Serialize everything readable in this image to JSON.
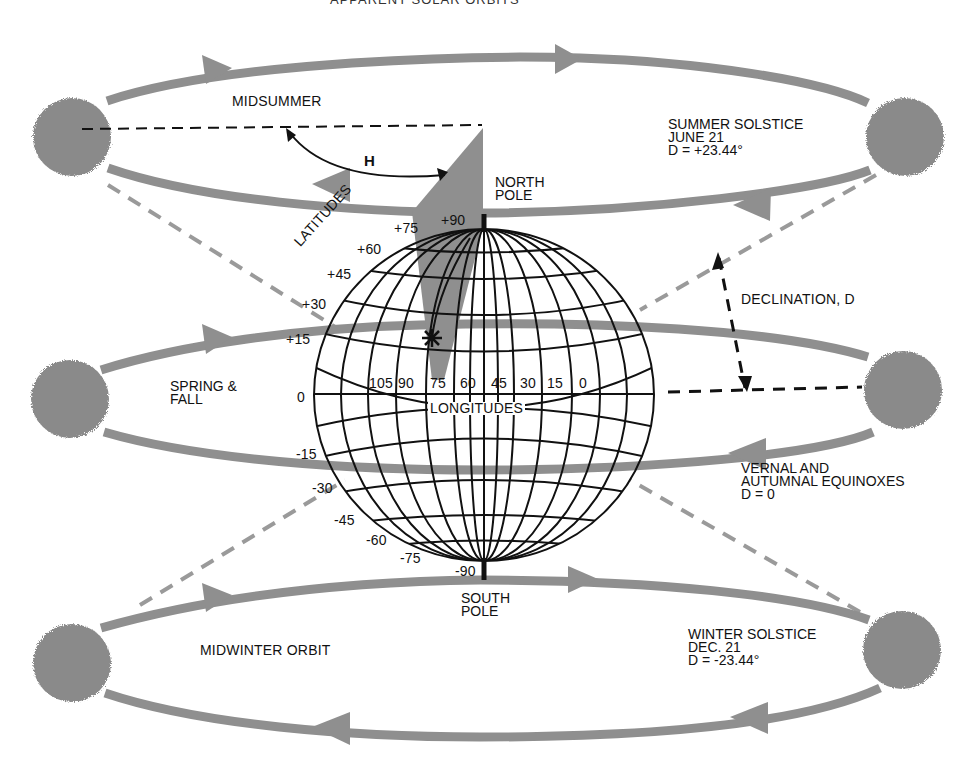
{
  "title": "APPARENT SOLAR ORBITS",
  "colors": {
    "orbit": "#8f8f8f",
    "sun": "#8a8a8a",
    "grid": "#111111",
    "dashed_black": "#111111",
    "dashed_gray": "#9a9a9a",
    "background": "#ffffff"
  },
  "orbits": [
    {
      "name": "midsummer",
      "label": "MIDSUMMER"
    },
    {
      "name": "spring-fall",
      "label_lines": [
        "SPRING &",
        "FALL"
      ]
    },
    {
      "name": "midwinter",
      "label": "MIDWINTER ORBIT"
    }
  ],
  "annotations": {
    "summer_solstice": [
      "SUMMER SOLSTICE",
      "JUNE 21",
      "D =  +23.44°"
    ],
    "equinoxes": [
      "VERNAL AND",
      "AUTUMNAL EQUINOXES",
      "D = 0"
    ],
    "winter_solstice": [
      "WINTER SOLSTICE",
      "DEC. 21",
      "D = -23.44°"
    ],
    "declination": "DECLINATION, D",
    "hour_angle": "H",
    "north_pole": [
      "NORTH",
      "POLE"
    ],
    "south_pole": [
      "SOUTH",
      "POLE"
    ],
    "latitudes_title": "LATITUDES",
    "longitudes_title": "LONGITUDES"
  },
  "globe": {
    "latitude_labels": [
      "+90",
      "+75",
      "+60",
      "+45",
      "+30",
      "+15",
      "0",
      "-15",
      "-30",
      "-45",
      "-60",
      "-75",
      "-90"
    ],
    "longitude_labels": [
      "105",
      "90",
      "75",
      "60",
      "45",
      "30",
      "15",
      "0"
    ]
  }
}
